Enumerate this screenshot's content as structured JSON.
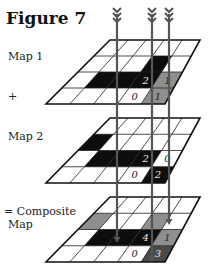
{
  "title": "Figure 7",
  "labels": [
    {
      "text": "Map 1",
      "x": 8,
      "y": 60
    },
    {
      "text": "+",
      "x": 8,
      "y": 100
    },
    {
      "text": "Map 2",
      "x": 8,
      "y": 140
    },
    {
      "text": "= Composite",
      "x": 4,
      "y": 215
    },
    {
      "text": "Map",
      "x": 8,
      "y": 228
    }
  ],
  "grid": {
    "cols": 5,
    "rows": 4
  },
  "colors": {
    "black": "#0d0d0d",
    "gray": "#8f8f8f",
    "darkgray": "#4a4a4a",
    "white": "#ffffff",
    "line": "#222222",
    "arrow": "#555555"
  },
  "maps": [
    {
      "name": "Map 1",
      "corners": {
        "tl": [
          110,
          40
        ],
        "tr": [
          200,
          40
        ],
        "bl": [
          46,
          104
        ],
        "br": [
          165,
          104
        ]
      },
      "cells": [
        {
          "r": 1,
          "c": 3,
          "fill": "black"
        },
        {
          "r": 2,
          "c": 1,
          "fill": "black"
        },
        {
          "r": 2,
          "c": 2,
          "fill": "black"
        },
        {
          "r": 2,
          "c": 3,
          "fill": "black",
          "value": "2"
        },
        {
          "r": 2,
          "c": 4,
          "fill": "gray",
          "value": "1"
        },
        {
          "r": 3,
          "c": 3,
          "fill": "white",
          "value": "0"
        },
        {
          "r": 3,
          "c": 4,
          "fill": "gray",
          "value": "1"
        }
      ]
    },
    {
      "name": "Map 2",
      "corners": {
        "tl": [
          110,
          118
        ],
        "tr": [
          200,
          118
        ],
        "bl": [
          46,
          183
        ],
        "br": [
          165,
          183
        ]
      },
      "cells": [
        {
          "r": 1,
          "c": 0,
          "fill": "black"
        },
        {
          "r": 2,
          "c": 1,
          "fill": "black"
        },
        {
          "r": 2,
          "c": 2,
          "fill": "black"
        },
        {
          "r": 2,
          "c": 3,
          "fill": "black",
          "value": "2"
        },
        {
          "r": 2,
          "c": 4,
          "fill": "white",
          "value": "0"
        },
        {
          "r": 3,
          "c": 3,
          "fill": "white",
          "value": "0"
        },
        {
          "r": 3,
          "c": 4,
          "fill": "black",
          "value": "2"
        }
      ]
    },
    {
      "name": "Composite Map",
      "corners": {
        "tl": [
          110,
          197
        ],
        "tr": [
          200,
          197
        ],
        "bl": [
          46,
          262
        ],
        "br": [
          165,
          262
        ]
      },
      "cells": [
        {
          "r": 1,
          "c": 0,
          "fill": "gray"
        },
        {
          "r": 1,
          "c": 3,
          "fill": "gray"
        },
        {
          "r": 2,
          "c": 1,
          "fill": "black"
        },
        {
          "r": 2,
          "c": 2,
          "fill": "black"
        },
        {
          "r": 2,
          "c": 3,
          "fill": "black",
          "value": "4"
        },
        {
          "r": 2,
          "c": 4,
          "fill": "gray",
          "value": "1"
        },
        {
          "r": 3,
          "c": 3,
          "fill": "white",
          "value": "0"
        },
        {
          "r": 3,
          "c": 4,
          "fill": "darkgray",
          "value": "3"
        }
      ]
    }
  ],
  "arrows": [
    {
      "x": 117,
      "y_top": 8,
      "y_bottom": 243
    },
    {
      "x": 152,
      "y_top": 8,
      "y_bottom": 262
    },
    {
      "x": 169,
      "y_top": 8,
      "y_bottom": 225
    }
  ]
}
